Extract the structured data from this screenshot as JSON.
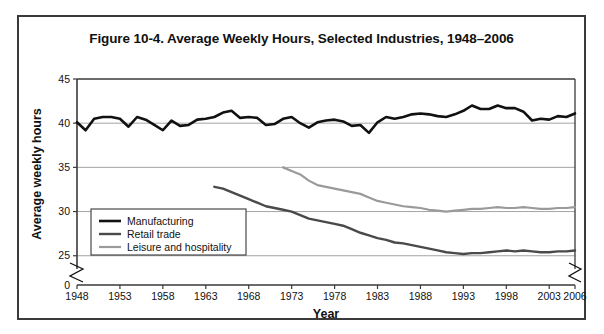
{
  "figure": {
    "title": "Figure 10-4. Average Weekly Hours, Selected Industries, 1948–2006"
  },
  "chart_data": {
    "type": "line",
    "title": "Figure 10-4. Average Weekly Hours, Selected Industries, 1948–2006",
    "xlabel": "Year",
    "ylabel": "Average weekly hours",
    "xlim": [
      1948,
      2006
    ],
    "ylim": [
      23.5,
      45
    ],
    "y_axis_break": true,
    "x_axis_break": true,
    "grid": "horizontal",
    "legend_position": "inside-bottom-left",
    "yticks": [
      0,
      25,
      30,
      35,
      40,
      45
    ],
    "ytick_labels": [
      "0",
      "25",
      "30",
      "35",
      "40",
      "45"
    ],
    "xticks": [
      1948,
      1953,
      1958,
      1963,
      1968,
      1973,
      1978,
      1983,
      1988,
      1993,
      1998,
      2003,
      2006
    ],
    "xtick_labels": [
      "1948",
      "1953",
      "1958",
      "1963",
      "1968",
      "1973",
      "1978",
      "1983",
      "1988",
      "1993",
      "1998",
      "2003",
      "2006"
    ],
    "colors": {
      "manufacturing": "#111111",
      "retail_trade": "#4a4a4a",
      "leisure_and_hospitality": "#9a9a9a"
    },
    "series": [
      {
        "name": "Manufacturing",
        "color": "#111111",
        "width": 2.6,
        "x": [
          1948,
          1949,
          1950,
          1951,
          1952,
          1953,
          1954,
          1955,
          1956,
          1957,
          1958,
          1959,
          1960,
          1961,
          1962,
          1963,
          1964,
          1965,
          1966,
          1967,
          1968,
          1969,
          1970,
          1971,
          1972,
          1973,
          1974,
          1975,
          1976,
          1977,
          1978,
          1979,
          1980,
          1981,
          1982,
          1983,
          1984,
          1985,
          1986,
          1987,
          1988,
          1989,
          1990,
          1991,
          1992,
          1993,
          1994,
          1995,
          1996,
          1997,
          1998,
          1999,
          2000,
          2001,
          2002,
          2003,
          2004,
          2005,
          2006
        ],
        "values": [
          40.1,
          39.2,
          40.5,
          40.7,
          40.7,
          40.5,
          39.6,
          40.7,
          40.4,
          39.8,
          39.2,
          40.3,
          39.7,
          39.8,
          40.4,
          40.5,
          40.7,
          41.2,
          41.4,
          40.6,
          40.7,
          40.6,
          39.8,
          39.9,
          40.5,
          40.7,
          40.0,
          39.5,
          40.1,
          40.3,
          40.4,
          40.2,
          39.7,
          39.8,
          38.9,
          40.1,
          40.7,
          40.5,
          40.7,
          41.0,
          41.1,
          41.0,
          40.8,
          40.7,
          41.0,
          41.4,
          42.0,
          41.6,
          41.6,
          42.0,
          41.7,
          41.7,
          41.3,
          40.3,
          40.5,
          40.4,
          40.8,
          40.7,
          41.1
        ]
      },
      {
        "name": "Retail trade",
        "color": "#4a4a4a",
        "width": 2.4,
        "x": [
          1964,
          1965,
          1966,
          1967,
          1968,
          1969,
          1970,
          1971,
          1972,
          1973,
          1974,
          1975,
          1976,
          1977,
          1978,
          1979,
          1980,
          1981,
          1982,
          1983,
          1984,
          1985,
          1986,
          1987,
          1988,
          1989,
          1990,
          1991,
          1992,
          1993,
          1994,
          1995,
          1996,
          1997,
          1998,
          1999,
          2000,
          2001,
          2002,
          2003,
          2004,
          2005,
          2006
        ],
        "values": [
          32.8,
          32.6,
          32.2,
          31.8,
          31.4,
          31.0,
          30.6,
          30.4,
          30.2,
          30.0,
          29.6,
          29.2,
          29.0,
          28.8,
          28.6,
          28.4,
          28.0,
          27.6,
          27.3,
          27.0,
          26.8,
          26.5,
          26.4,
          26.2,
          26.0,
          25.8,
          25.6,
          25.4,
          25.3,
          25.2,
          25.3,
          25.3,
          25.4,
          25.5,
          25.6,
          25.5,
          25.6,
          25.5,
          25.4,
          25.4,
          25.5,
          25.5,
          25.6
        ]
      },
      {
        "name": "Leisure and hospitality",
        "color": "#9a9a9a",
        "width": 2.2,
        "x": [
          1972,
          1973,
          1974,
          1975,
          1976,
          1977,
          1978,
          1979,
          1980,
          1981,
          1982,
          1983,
          1984,
          1985,
          1986,
          1987,
          1988,
          1989,
          1990,
          1991,
          1992,
          1993,
          1994,
          1995,
          1996,
          1997,
          1998,
          1999,
          2000,
          2001,
          2002,
          2003,
          2004,
          2005,
          2006
        ],
        "values": [
          35.0,
          34.6,
          34.2,
          33.5,
          33.0,
          32.8,
          32.6,
          32.4,
          32.2,
          32.0,
          31.6,
          31.2,
          31.0,
          30.8,
          30.6,
          30.5,
          30.4,
          30.2,
          30.1,
          30.0,
          30.1,
          30.2,
          30.3,
          30.3,
          30.4,
          30.5,
          30.4,
          30.4,
          30.5,
          30.4,
          30.3,
          30.3,
          30.4,
          30.4,
          30.5
        ]
      }
    ],
    "legend": [
      {
        "label": "Manufacturing",
        "color": "#111111",
        "width": 2.6
      },
      {
        "label": "Retail trade",
        "color": "#4a4a4a",
        "width": 2.4
      },
      {
        "label": "Leisure and hospitality",
        "color": "#9a9a9a",
        "width": 2.2
      }
    ]
  }
}
